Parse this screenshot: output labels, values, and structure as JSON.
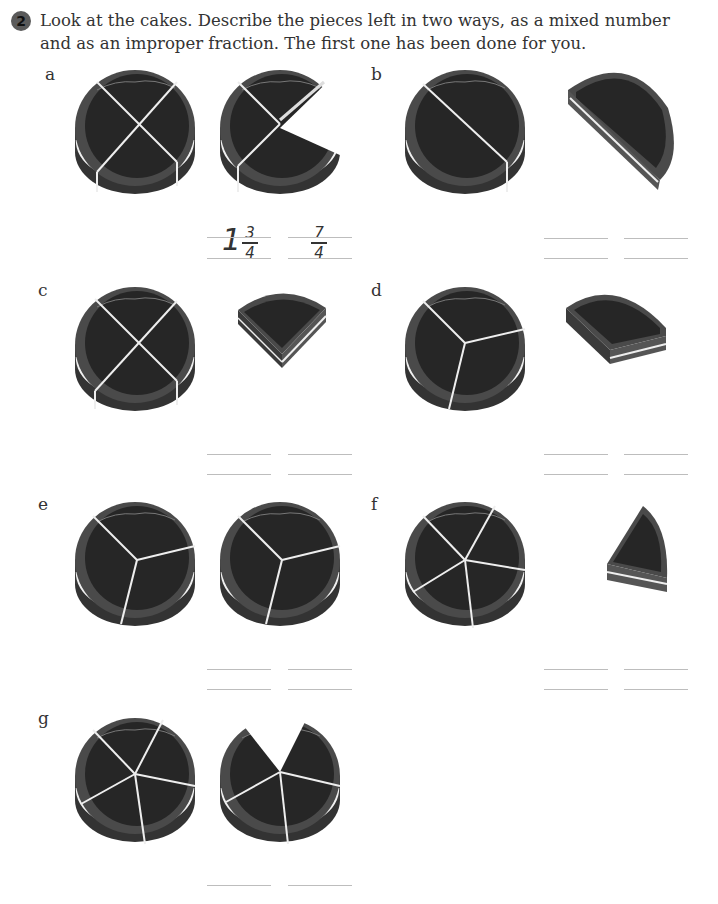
{
  "question": {
    "number": "2",
    "instruction": "Look at the cakes. Describe the pieces left in two ways, as a mixed number and as an improper fraction. The first one has been done for you."
  },
  "items": [
    {
      "label": "a",
      "cakes": [
        "whole cake cut into 4 quarters",
        "cake with 3 of 4 quarters"
      ],
      "answer_mixed": {
        "whole": "1",
        "numerator": "3",
        "denominator": "4"
      },
      "answer_improper": {
        "numerator": "7",
        "denominator": "4"
      }
    },
    {
      "label": "b",
      "cakes": [
        "whole cake cut into 2 halves",
        "one half"
      ],
      "answer_mixed": null,
      "answer_improper": null
    },
    {
      "label": "c",
      "cakes": [
        "whole cake cut into 4 quarters",
        "one quarter"
      ],
      "answer_mixed": null,
      "answer_improper": null
    },
    {
      "label": "d",
      "cakes": [
        "whole cake cut into 3 thirds",
        "one third"
      ],
      "answer_mixed": null,
      "answer_improper": null
    },
    {
      "label": "e",
      "cakes": [
        "whole cake cut into 3 thirds",
        "whole cake cut into 3 thirds"
      ],
      "answer_mixed": null,
      "answer_improper": null
    },
    {
      "label": "f",
      "cakes": [
        "whole cake cut into 5 fifths",
        "one fifth"
      ],
      "answer_mixed": null,
      "answer_improper": null
    },
    {
      "label": "g",
      "cakes": [
        "whole cake cut into 5 fifths",
        "cake with 4 of 5 fifths"
      ],
      "answer_mixed": null,
      "answer_improper": null
    }
  ],
  "colors": {
    "cake_top": "#2b2b2b",
    "cake_side": "#3c3c3c",
    "cake_rim": "#555555",
    "cut_line": "#f0f0f0",
    "answer_line": "#bdbdbd"
  }
}
